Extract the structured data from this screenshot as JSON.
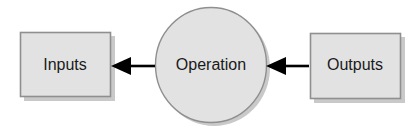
{
  "diagram": {
    "background_color": "#ffffff",
    "shape_fill": "#e2e2e2",
    "shape_stroke": "#8f8f8f",
    "shadow_color": "#c9c9c9",
    "arrow_color": "#000000",
    "text_color": "#1a1a1a",
    "nodes": [
      {
        "id": "inputs",
        "label": "Inputs",
        "shape": "rectangle",
        "x": 20,
        "y": 32,
        "width": 91,
        "height": 65,
        "center_x": 65,
        "center_y": 65
      },
      {
        "id": "operation",
        "label": "Operation",
        "shape": "ellipse",
        "center_x": 211,
        "center_y": 65,
        "radius_x": 56,
        "radius_y": 58
      },
      {
        "id": "outputs",
        "label": "Outputs",
        "shape": "rectangle",
        "x": 310,
        "y": 33,
        "width": 91,
        "height": 66,
        "center_x": 355,
        "center_y": 66
      }
    ],
    "arrows": [
      {
        "id": "operation-to-inputs",
        "from": "operation",
        "to": "inputs",
        "direction": "left",
        "tail_x": 155,
        "head_x": 112,
        "y": 66
      },
      {
        "id": "outputs-to-operation",
        "from": "outputs",
        "to": "operation",
        "direction": "left",
        "tail_x": 309,
        "head_x": 267,
        "y": 66
      }
    ]
  }
}
